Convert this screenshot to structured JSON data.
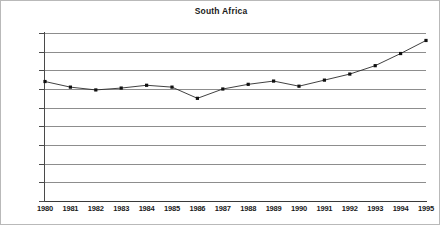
{
  "chart_data": {
    "type": "line",
    "title": "South Africa",
    "xlabel": "",
    "ylabel": "",
    "categories": [
      "1980",
      "1981",
      "1982",
      "1983",
      "1984",
      "1985",
      "1986",
      "1987",
      "1988",
      "1989",
      "1990",
      "1991",
      "1992",
      "1993",
      "1994",
      "1995"
    ],
    "values": [
      128000,
      122000,
      119000,
      121000,
      124000,
      122000,
      110000,
      120000,
      125000,
      128500,
      123000,
      129500,
      136000,
      145000,
      158000,
      172000
    ],
    "series": [
      {
        "name": "South Africa",
        "values": [
          128000,
          122000,
          119000,
          121000,
          124000,
          122000,
          110000,
          120000,
          125000,
          128500,
          123000,
          129500,
          136000,
          145000,
          158000,
          172000
        ]
      }
    ],
    "ylim": [
      0,
      180000
    ],
    "ytick_labels": [
      "0",
      "20000",
      "40000",
      "60000",
      "80000",
      "100000",
      "120000",
      "140000",
      "160000",
      "180000"
    ],
    "ytick_values": [
      0,
      20000,
      40000,
      60000,
      80000,
      100000,
      120000,
      140000,
      160000,
      180000
    ],
    "grid": "horizontal",
    "legend": "none",
    "marker": "filled-square",
    "line_color": "#2b2b2b",
    "marker_color": "#111111",
    "grid_color": "#8d8d8d",
    "background_color": "#ffffff"
  }
}
